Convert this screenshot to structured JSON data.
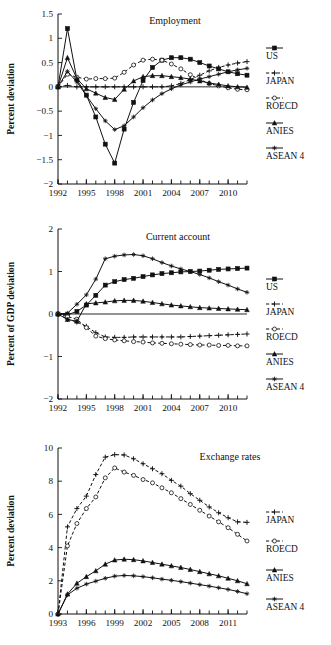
{
  "figure": {
    "panel_count": 3,
    "background": "#ffffff",
    "ink": "#111111"
  },
  "chart_data": [
    {
      "type": "line",
      "id": "employment",
      "title": "Employment",
      "xlabel": "",
      "ylabel": "Percent deviation",
      "xlim": [
        1992,
        2012
      ],
      "ylim": [
        -2,
        1.5
      ],
      "yticks": [
        1.5,
        1,
        0.5,
        0,
        -0.5,
        -1,
        -1.5,
        -2
      ],
      "ytick_labels": [
        "1.5",
        "1",
        "0.5",
        "0",
        "-0.5",
        "-1",
        "-1.5",
        "-2"
      ],
      "xticks": [
        1992,
        1995,
        1998,
        2001,
        2004,
        2007,
        2010
      ],
      "xtick_labels": [
        "1992",
        "1995",
        "1998",
        "2001",
        "2004",
        "2007",
        "2010"
      ],
      "minor_xticks": true,
      "grid": false,
      "zero_line": true,
      "legend_position": "right",
      "x": [
        1992,
        1993,
        1994,
        1995,
        1996,
        1997,
        1998,
        1999,
        2000,
        2001,
        2002,
        2003,
        2004,
        2005,
        2006,
        2007,
        2008,
        2009,
        2010,
        2011,
        2012
      ],
      "series": [
        {
          "name": "US",
          "marker": "filled-square",
          "dash": "solid",
          "values": [
            0.0,
            1.2,
            0.15,
            -0.17,
            -0.62,
            -1.18,
            -1.57,
            -0.87,
            -0.32,
            0.13,
            0.4,
            0.55,
            0.6,
            0.6,
            0.57,
            0.5,
            0.43,
            0.37,
            0.31,
            0.27,
            0.24
          ]
        },
        {
          "name": "JAPAN",
          "marker": "plus",
          "dash": "dashed",
          "values": [
            0.0,
            0.03,
            0.0,
            0.0,
            0.0,
            0.0,
            0.0,
            0.0,
            0.0,
            0.0,
            0.0,
            0.0,
            0.02,
            0.07,
            0.15,
            0.24,
            0.33,
            0.4,
            0.45,
            0.49,
            0.52
          ]
        },
        {
          "name": "ROECD",
          "marker": "open-circle",
          "dash": "dashed",
          "values": [
            0.0,
            0.26,
            0.2,
            0.16,
            0.17,
            0.17,
            0.18,
            0.3,
            0.45,
            0.55,
            0.57,
            0.55,
            0.47,
            0.37,
            0.25,
            0.15,
            0.07,
            0.02,
            -0.02,
            -0.05,
            -0.06
          ]
        },
        {
          "name": "ANIES",
          "marker": "filled-triangle",
          "dash": "solid",
          "values": [
            0.0,
            0.6,
            0.17,
            -0.04,
            -0.13,
            -0.22,
            -0.26,
            -0.05,
            0.12,
            0.21,
            0.23,
            0.23,
            0.21,
            0.19,
            0.16,
            0.12,
            0.08,
            0.05,
            0.02,
            0.0,
            -0.01
          ]
        },
        {
          "name": "ASEAN 4",
          "marker": "star",
          "dash": "solid",
          "values": [
            0.0,
            0.32,
            0.1,
            -0.18,
            -0.45,
            -0.7,
            -0.88,
            -0.8,
            -0.62,
            -0.43,
            -0.27,
            -0.14,
            -0.04,
            0.04,
            0.1,
            0.16,
            0.21,
            0.26,
            0.31,
            0.35,
            0.38
          ]
        }
      ]
    },
    {
      "type": "line",
      "id": "current-account",
      "title": "Current account",
      "xlabel": "",
      "ylabel": "Percent of GDP deviation",
      "xlim": [
        1992,
        2012
      ],
      "ylim": [
        -2,
        2
      ],
      "yticks": [
        2,
        1,
        0,
        -1,
        -2
      ],
      "ytick_labels": [
        "2",
        "1",
        "0",
        "-1",
        "-2"
      ],
      "xticks": [
        1992,
        1995,
        1998,
        2001,
        2004,
        2007,
        2010
      ],
      "xtick_labels": [
        "1992",
        "1995",
        "1998",
        "2001",
        "2004",
        "2007",
        "2010"
      ],
      "minor_xticks": true,
      "grid": false,
      "zero_line": true,
      "legend_position": "right",
      "x": [
        1992,
        1993,
        1994,
        1995,
        1996,
        1997,
        1998,
        1999,
        2000,
        2001,
        2002,
        2003,
        2004,
        2005,
        2006,
        2007,
        2008,
        2009,
        2010,
        2011,
        2012
      ],
      "series": [
        {
          "name": "US",
          "marker": "filled-square",
          "dash": "solid",
          "values": [
            0.0,
            -0.02,
            0.06,
            0.21,
            0.44,
            0.68,
            0.76,
            0.81,
            0.84,
            0.88,
            0.92,
            0.95,
            0.97,
            0.99,
            1.0,
            1.01,
            1.03,
            1.05,
            1.06,
            1.07,
            1.08
          ]
        },
        {
          "name": "JAPAN",
          "marker": "plus",
          "dash": "dashed",
          "values": [
            0.0,
            -0.12,
            -0.19,
            -0.29,
            -0.44,
            -0.54,
            -0.55,
            -0.55,
            -0.54,
            -0.54,
            -0.54,
            -0.54,
            -0.54,
            -0.54,
            -0.53,
            -0.52,
            -0.51,
            -0.5,
            -0.49,
            -0.48,
            -0.47
          ]
        },
        {
          "name": "ROECD",
          "marker": "open-circle",
          "dash": "dashed",
          "values": [
            0.0,
            -0.06,
            -0.12,
            -0.32,
            -0.52,
            -0.58,
            -0.61,
            -0.63,
            -0.65,
            -0.66,
            -0.68,
            -0.69,
            -0.7,
            -0.71,
            -0.72,
            -0.73,
            -0.73,
            -0.74,
            -0.74,
            -0.75,
            -0.75
          ]
        },
        {
          "name": "ANIES",
          "marker": "filled-triangle",
          "dash": "solid",
          "values": [
            0.0,
            -0.13,
            -0.17,
            0.24,
            0.26,
            0.28,
            0.31,
            0.32,
            0.32,
            0.3,
            0.27,
            0.24,
            0.21,
            0.19,
            0.17,
            0.15,
            0.14,
            0.13,
            0.12,
            0.11,
            0.1
          ]
        },
        {
          "name": "ASEAN 4",
          "marker": "star",
          "dash": "solid",
          "values": [
            0.0,
            0.02,
            0.23,
            0.45,
            0.82,
            1.3,
            1.36,
            1.39,
            1.4,
            1.37,
            1.3,
            1.21,
            1.13,
            1.06,
            1.0,
            0.93,
            0.85,
            0.76,
            0.68,
            0.59,
            0.51
          ]
        }
      ]
    },
    {
      "type": "line",
      "id": "exchange-rates",
      "title": "Exchange rates",
      "xlabel": "",
      "ylabel": "Percent deviation",
      "xlim": [
        1993,
        2013
      ],
      "ylim": [
        0,
        10
      ],
      "yticks": [
        10,
        8,
        6,
        4,
        2,
        0
      ],
      "ytick_labels": [
        "10",
        "8",
        "6",
        "4",
        "2",
        "0"
      ],
      "xticks": [
        1993,
        1996,
        1999,
        2002,
        2005,
        2008,
        2011
      ],
      "xtick_labels": [
        "1993",
        "1996",
        "1999",
        "2002",
        "2005",
        "2008",
        "2011"
      ],
      "minor_xticks": true,
      "grid": false,
      "zero_line": false,
      "legend_position": "right",
      "x": [
        1993,
        1994,
        1995,
        1996,
        1997,
        1998,
        1999,
        2000,
        2001,
        2002,
        2003,
        2004,
        2005,
        2006,
        2007,
        2008,
        2009,
        2010,
        2011,
        2012,
        2013
      ],
      "series": [
        {
          "name": "JAPAN",
          "marker": "plus",
          "dash": "dashed",
          "values": [
            0.0,
            5.25,
            6.35,
            7.1,
            8.4,
            9.45,
            9.6,
            9.58,
            9.35,
            9.05,
            8.75,
            8.45,
            8.05,
            7.7,
            7.25,
            6.85,
            6.45,
            6.1,
            5.8,
            5.55,
            5.52
          ]
        },
        {
          "name": "ROECD",
          "marker": "open-circle",
          "dash": "dashed",
          "values": [
            0.0,
            4.1,
            5.45,
            6.35,
            7.05,
            8.2,
            8.8,
            8.55,
            8.35,
            8.1,
            7.9,
            7.6,
            7.3,
            6.95,
            6.6,
            6.25,
            5.9,
            5.55,
            5.2,
            4.8,
            4.4
          ]
        },
        {
          "name": "ANIES",
          "marker": "filled-triangle",
          "dash": "solid",
          "values": [
            0.0,
            1.2,
            1.85,
            2.25,
            2.6,
            3.0,
            3.25,
            3.3,
            3.27,
            3.2,
            3.1,
            3.0,
            2.9,
            2.8,
            2.68,
            2.55,
            2.42,
            2.3,
            2.15,
            2.0,
            1.82
          ]
        },
        {
          "name": "ASEAN 4",
          "marker": "star",
          "dash": "solid",
          "values": [
            0.0,
            1.15,
            1.55,
            1.8,
            1.98,
            2.15,
            2.28,
            2.32,
            2.3,
            2.25,
            2.18,
            2.1,
            2.03,
            1.95,
            1.86,
            1.77,
            1.68,
            1.58,
            1.48,
            1.36,
            1.22
          ]
        }
      ]
    }
  ],
  "legends": [
    {
      "panel": "employment",
      "entries": [
        {
          "label": "US",
          "marker": "filled-square",
          "dash": "solid"
        },
        {
          "label": "JAPAN",
          "marker": "plus",
          "dash": "dashed"
        },
        {
          "label": "ROECD",
          "marker": "open-circle",
          "dash": "dashed"
        },
        {
          "label": "ANIES",
          "marker": "filled-triangle",
          "dash": "solid"
        },
        {
          "label": "ASEAN 4",
          "marker": "star",
          "dash": "solid"
        }
      ]
    },
    {
      "panel": "current-account",
      "entries": [
        {
          "label": "US",
          "marker": "filled-square",
          "dash": "solid"
        },
        {
          "label": "JAPAN",
          "marker": "plus",
          "dash": "dashed"
        },
        {
          "label": "ROECD",
          "marker": "open-circle",
          "dash": "dashed"
        },
        {
          "label": "ANIES",
          "marker": "filled-triangle",
          "dash": "solid"
        },
        {
          "label": "ASEAN 4",
          "marker": "star",
          "dash": "solid"
        }
      ]
    },
    {
      "panel": "exchange-rates",
      "entries": [
        {
          "label": "JAPAN",
          "marker": "plus",
          "dash": "dashed"
        },
        {
          "label": "ROECD",
          "marker": "open-circle",
          "dash": "dashed"
        },
        {
          "label": "ANIES",
          "marker": "filled-triangle",
          "dash": "solid"
        },
        {
          "label": "ASEAN 4",
          "marker": "star",
          "dash": "solid"
        }
      ]
    }
  ]
}
